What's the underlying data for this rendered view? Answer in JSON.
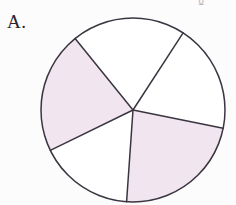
{
  "figure": {
    "part_label": "A.",
    "top_artifact_glyph": "g",
    "background_color": "#fdfcfc",
    "stroke_color": "#3a3540",
    "stroke_width": 1.5,
    "shaded_fill": "#f1e5ef",
    "unshaded_fill": "#ffffff"
  },
  "chart_data": {
    "type": "pie",
    "title": "",
    "subtitle": "",
    "xlabel": "",
    "ylabel": "",
    "legend_position": "none",
    "grid": false,
    "center": {
      "x": 133,
      "y": 110
    },
    "radius": 92,
    "slice_count": 5,
    "shaded_count": 2,
    "unshaded_count": 3,
    "categories": [
      "upper-right sector",
      "top sector",
      "upper-left sector",
      "bottom-left sector",
      "right sector"
    ],
    "values": [
      68,
      72,
      77,
      72,
      71
    ],
    "shaded": [
      false,
      false,
      true,
      false,
      true
    ],
    "boundary_angles_deg": [
      348.5,
      57,
      129,
      206,
      266
    ],
    "slices": [
      {
        "name": "upper-right sector",
        "start_angle_deg": 348.5,
        "end_angle_deg": 57,
        "sweep_deg": 68.5,
        "fill": "#ffffff",
        "shaded": false
      },
      {
        "name": "top sector",
        "start_angle_deg": 57,
        "end_angle_deg": 129,
        "sweep_deg": 72,
        "fill": "#ffffff",
        "shaded": false
      },
      {
        "name": "upper-left sector",
        "start_angle_deg": 129,
        "end_angle_deg": 206,
        "sweep_deg": 77,
        "fill": "#f1e5ef",
        "shaded": true
      },
      {
        "name": "bottom-left sector",
        "start_angle_deg": 206,
        "end_angle_deg": 266,
        "sweep_deg": 60,
        "fill": "#ffffff",
        "shaded": false
      },
      {
        "name": "right sector",
        "start_angle_deg": 266,
        "end_angle_deg": 348.5,
        "sweep_deg": 82.5,
        "fill": "#f1e5ef",
        "shaded": true
      }
    ]
  }
}
